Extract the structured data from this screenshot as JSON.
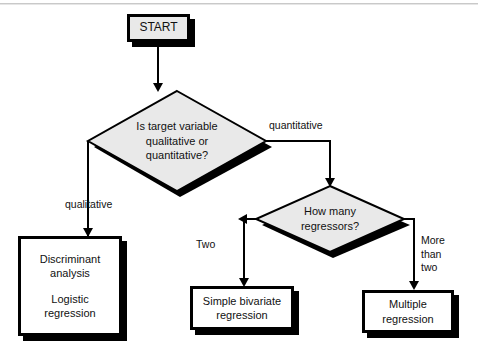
{
  "diagram": {
    "type": "flowchart",
    "nodes": {
      "start": {
        "label": "START",
        "shape": "terminal"
      },
      "decision_target": {
        "label": "Is target variable\nqualitative or\nquantitative?",
        "shape": "diamond"
      },
      "decision_regressors": {
        "label": "How many\nregressors?",
        "shape": "diamond"
      },
      "qualitative_methods": {
        "label_line1": "Discriminant\nanalysis",
        "label_line2": "Logistic\nregression",
        "shape": "process"
      },
      "simple_bivariate": {
        "label": "Simple bivariate\nregression",
        "shape": "process"
      },
      "multiple": {
        "label": "Multiple\nregression",
        "shape": "process"
      }
    },
    "edges": {
      "qualitative": "qualitative",
      "quantitative": "quantitative",
      "two": "Two",
      "more_than_two": "More\nthan\ntwo"
    }
  },
  "colors": {
    "ink": "#000000",
    "text": "#111111",
    "node_fill": "#e9e9e9",
    "box_fill": "#ffffff",
    "page": "#ffffff"
  }
}
